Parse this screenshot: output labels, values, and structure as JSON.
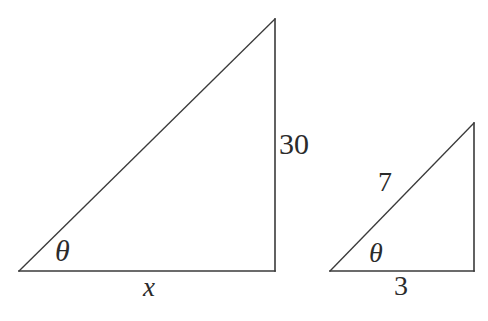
{
  "canvas": {
    "width": 488,
    "height": 321,
    "background_color": "#ffffff",
    "stroke_color": "#3a3a3a",
    "text_color": "#2b2b2b"
  },
  "figure": {
    "shapes": [
      {
        "name": "large-triangle",
        "vertices": {
          "bottom_left": [
            19,
            271
          ],
          "bottom_right": [
            275,
            271
          ],
          "apex": [
            275,
            19
          ]
        },
        "sides": {
          "base_label": "x",
          "vertical_label": "30",
          "hypotenuse_label": ""
        },
        "angle_label": "θ"
      },
      {
        "name": "small-triangle",
        "vertices": {
          "bottom_left": [
            330,
            271
          ],
          "bottom_right": [
            474,
            271
          ],
          "apex": [
            474,
            123
          ]
        },
        "sides": {
          "base_label": "3",
          "vertical_label": "",
          "hypotenuse_label": "7"
        },
        "angle_label": "θ"
      }
    ]
  },
  "labels": {
    "large_vertical": "30",
    "large_base": "x",
    "large_angle": "θ",
    "small_hypotenuse": "7",
    "small_base": "3",
    "small_angle": "θ"
  },
  "chart_data": {
    "type": "diagram",
    "xlabel": "",
    "ylabel": "",
    "items": [
      {
        "name": "large-triangle",
        "opposite": "30",
        "adjacent": "x",
        "hypotenuse": "",
        "angle": "θ"
      },
      {
        "name": "small-triangle",
        "opposite": "",
        "adjacent": "3",
        "hypotenuse": "7",
        "angle": "θ"
      }
    ]
  }
}
